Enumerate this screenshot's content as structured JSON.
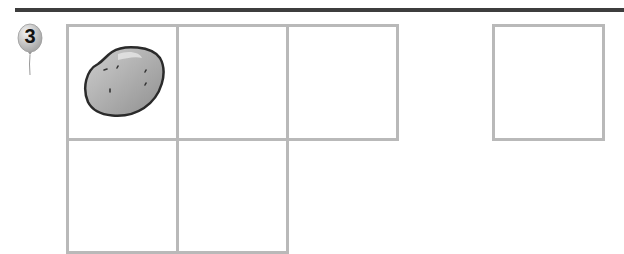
{
  "exercise": {
    "number": "3",
    "badge_shape": "balloon",
    "grid": {
      "rows": [
        {
          "cells": [
            {
              "content": "potato-icon"
            },
            {
              "content": ""
            },
            {
              "content": ""
            }
          ]
        },
        {
          "cells": [
            {
              "content": ""
            },
            {
              "content": ""
            }
          ]
        }
      ]
    },
    "answer_box": {
      "content": ""
    }
  },
  "colors": {
    "rule": "#3d3d3d",
    "box_border": "#b9b9b9",
    "balloon": "#c8c8c8",
    "potato": "#a9a9a9"
  }
}
